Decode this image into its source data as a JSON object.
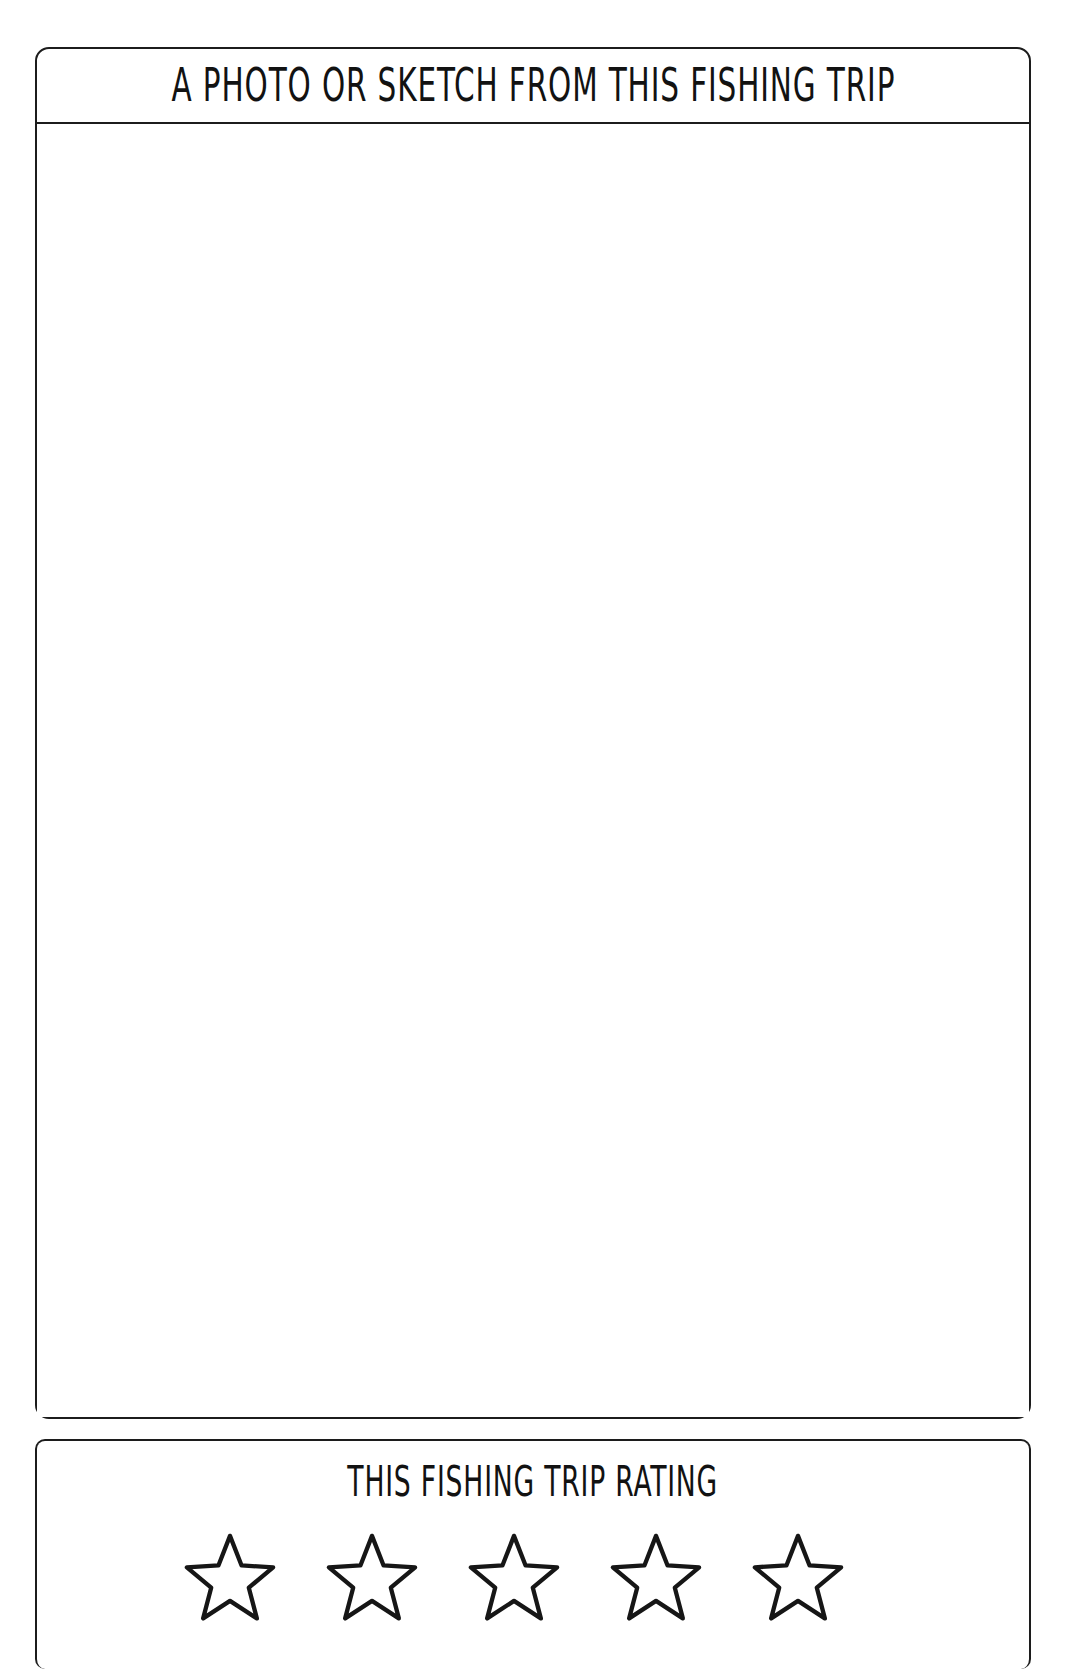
{
  "page": {
    "background_color": "#ffffff",
    "ink_color": "#1c1c1c",
    "width": 1085,
    "height": 1628
  },
  "photo_panel": {
    "title": "A PHOTO OR SKETCH FROM THIS FISHING TRIP",
    "canvas_placeholder": ""
  },
  "rating_panel": {
    "title": "THIS FISHING TRIP RATING",
    "star_count": 5,
    "filled_count": 0,
    "stars": [
      {
        "index": 1,
        "filled": false,
        "icon": "star-outline-icon"
      },
      {
        "index": 2,
        "filled": false,
        "icon": "star-outline-icon"
      },
      {
        "index": 3,
        "filled": false,
        "icon": "star-outline-icon"
      },
      {
        "index": 4,
        "filled": false,
        "icon": "star-outline-icon"
      },
      {
        "index": 5,
        "filled": false,
        "icon": "star-outline-icon"
      }
    ]
  }
}
